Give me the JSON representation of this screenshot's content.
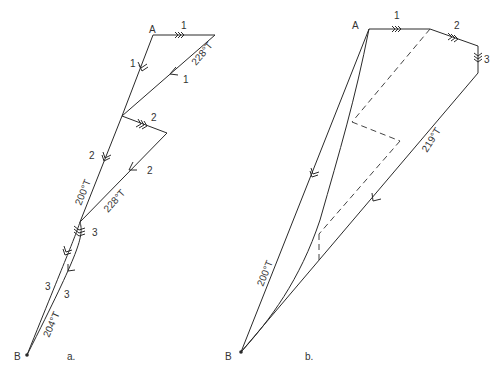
{
  "diagram_a": {
    "caption": "a.",
    "point_A": "A",
    "point_B": "B",
    "labels": {
      "tide1_top": "1",
      "course1": "1",
      "track1": "1",
      "bearing1": "228°T",
      "tide2": "2",
      "course2": "2",
      "track2": "2",
      "bearing2_course": "200°T",
      "bearing2_track": "228°T",
      "tide3": "3",
      "course3": "3",
      "track3": "3",
      "bearing3": "204°T"
    }
  },
  "diagram_b": {
    "caption": "b.",
    "point_A": "A",
    "point_B": "B",
    "labels": {
      "tide1": "1",
      "tide2": "2",
      "tide3": "3",
      "bearing_track": "219°T",
      "bearing_course": "200°T"
    }
  },
  "colors": {
    "line": "#2a2a2a",
    "text": "#333333",
    "background": "#ffffff"
  }
}
